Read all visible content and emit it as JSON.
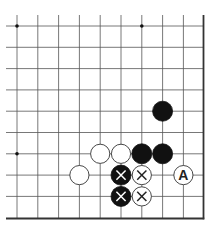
{
  "board": {
    "description": "Go problem diagram, lower-right corner section",
    "columns": 10,
    "rows": 10,
    "edges": [
      "right",
      "bottom"
    ],
    "star_points": [
      {
        "col": 0,
        "row": 0
      },
      {
        "col": 6,
        "row": 0
      },
      {
        "col": 0,
        "row": 6
      }
    ],
    "stones": [
      {
        "color": "black",
        "col": 7,
        "row": 4,
        "mark": ""
      },
      {
        "color": "white",
        "col": 4,
        "row": 6,
        "mark": ""
      },
      {
        "color": "white",
        "col": 5,
        "row": 6,
        "mark": ""
      },
      {
        "color": "black",
        "col": 6,
        "row": 6,
        "mark": ""
      },
      {
        "color": "black",
        "col": 7,
        "row": 6,
        "mark": ""
      },
      {
        "color": "white",
        "col": 3,
        "row": 7,
        "mark": ""
      },
      {
        "color": "black",
        "col": 5,
        "row": 7,
        "mark": "cross"
      },
      {
        "color": "white",
        "col": 6,
        "row": 7,
        "mark": "cross"
      },
      {
        "color": "white",
        "col": 8,
        "row": 7,
        "mark": "A"
      },
      {
        "color": "black",
        "col": 5,
        "row": 8,
        "mark": "cross"
      },
      {
        "color": "white",
        "col": 6,
        "row": 8,
        "mark": "cross"
      }
    ],
    "colors": {
      "line": "#555555",
      "edge": "#333333",
      "black_stone": "#111111",
      "white_stone": "#ffffff",
      "stone_outline": "#333333",
      "mark_on_black": "#ffffff",
      "mark_on_white": "#222222"
    }
  }
}
